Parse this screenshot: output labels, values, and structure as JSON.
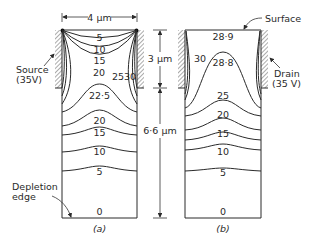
{
  "figure": {
    "panel_a": {
      "caption": "(a)",
      "contours": [
        {
          "value": "5"
        },
        {
          "value": "10"
        },
        {
          "value": "15"
        },
        {
          "value": "20"
        },
        {
          "value": "25"
        },
        {
          "value": "30"
        },
        {
          "value": "22·5"
        },
        {
          "value": "20"
        },
        {
          "value": "15"
        },
        {
          "value": "10"
        },
        {
          "value": "5"
        },
        {
          "value": "0"
        }
      ],
      "source_label_line1": "Source",
      "source_label_line2": "(35V)",
      "depletion_label_line1": "Depletion",
      "depletion_label_line2": "edge",
      "width_dimension": "4 μm"
    },
    "panel_b": {
      "caption": "(b)",
      "contours": [
        {
          "value": "28·9"
        },
        {
          "value": "30"
        },
        {
          "value": "28·8"
        },
        {
          "value": "25"
        },
        {
          "value": "20"
        },
        {
          "value": "15"
        },
        {
          "value": "10"
        },
        {
          "value": "5"
        },
        {
          "value": "0"
        }
      ],
      "surface_label": "Surface",
      "drain_label_line1": "Drain",
      "drain_label_line2": "(35 V)"
    },
    "dimensions": {
      "upper": "3 μm",
      "lower": "6·6 μm"
    }
  }
}
